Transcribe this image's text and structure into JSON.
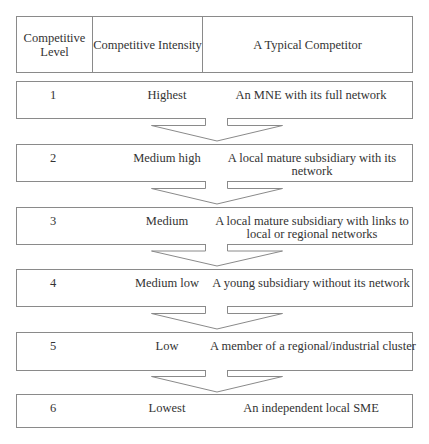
{
  "header": {
    "level_label": "Competitive Level",
    "intensity_label": "Competitive Intensity",
    "competitor_label": "A Typical Competitor"
  },
  "rows": [
    {
      "level": "1",
      "intensity": "Highest",
      "competitor": "An MNE with its full network"
    },
    {
      "level": "2",
      "intensity": "Medium high",
      "competitor": "A local mature subsidiary with its network"
    },
    {
      "level": "3",
      "intensity": "Medium",
      "competitor": "A local mature subsidiary with links to local or regional networks"
    },
    {
      "level": "4",
      "intensity": "Medium low",
      "competitor": "A young subsidiary without its network"
    },
    {
      "level": "5",
      "intensity": "Low",
      "competitor": "A member of a regional/industrial cluster"
    },
    {
      "level": "6",
      "intensity": "Lowest",
      "competitor": "An independent local SME"
    }
  ],
  "colors": {
    "border": "#8a8a8a",
    "text": "#333333"
  }
}
